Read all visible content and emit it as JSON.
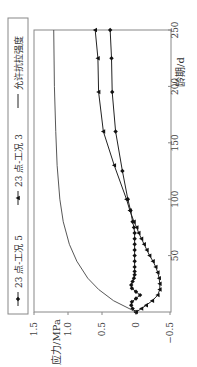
{
  "chart_data": {
    "type": "line",
    "title": "",
    "xlabel": "龄期/d",
    "ylabel": "应力/MPa",
    "xlim": [
      0,
      250
    ],
    "ylim": [
      -0.5,
      1.5
    ],
    "xticks": [
      "50",
      "100",
      "150",
      "200",
      "250"
    ],
    "yticks": [
      "1.5",
      "1.0",
      "0.5",
      "0",
      "-0.5"
    ],
    "grid": false,
    "legend_position": "top (rotated, left side)",
    "orientation": "rotated 90° counter-clockwise",
    "series": [
      {
        "name": "23 点-工况 5",
        "marker": "diamond",
        "x": [
          0,
          3,
          6,
          9,
          12,
          15,
          18,
          21,
          24,
          27,
          30,
          33,
          36,
          40,
          45,
          50,
          55,
          60,
          65,
          70,
          75,
          80,
          90,
          100,
          125,
          160,
          195,
          225,
          250
        ],
        "y": [
          0,
          0.05,
          0.07,
          0.06,
          0.0,
          -0.06,
          0.0,
          0.06,
          0.07,
          0.05,
          0.03,
          0.02,
          0.02,
          0.02,
          0.02,
          0.02,
          0.02,
          0.02,
          0.02,
          0.02,
          0.03,
          0.05,
          0.08,
          0.12,
          0.2,
          0.3,
          0.35,
          0.36,
          0.38
        ]
      },
      {
        "name": "23 点-工况 3",
        "marker": "triangle",
        "x": [
          0,
          3,
          6,
          10,
          15,
          20,
          25,
          30,
          35,
          40,
          45,
          50,
          55,
          60,
          65,
          70,
          75,
          80,
          90,
          100,
          130,
          160,
          195,
          225,
          250
        ],
        "y": [
          0,
          -0.08,
          -0.15,
          -0.24,
          -0.32,
          -0.35,
          -0.35,
          -0.34,
          -0.32,
          -0.29,
          -0.25,
          -0.2,
          -0.16,
          -0.12,
          -0.08,
          -0.04,
          -0.01,
          0.03,
          0.09,
          0.14,
          0.32,
          0.48,
          0.55,
          0.56,
          0.6
        ]
      },
      {
        "name": "允许抗拉强度",
        "marker": "none",
        "x": [
          0,
          10,
          20,
          30,
          45,
          60,
          80,
          100,
          130,
          160,
          200,
          250
        ],
        "y": [
          0,
          0.33,
          0.55,
          0.71,
          0.87,
          0.98,
          1.07,
          1.12,
          1.16,
          1.18,
          1.2,
          1.21
        ]
      }
    ]
  },
  "legend": {
    "items": [
      "23 点-工况 5",
      "23 点-工况 3",
      "允许抗拉强度"
    ]
  }
}
